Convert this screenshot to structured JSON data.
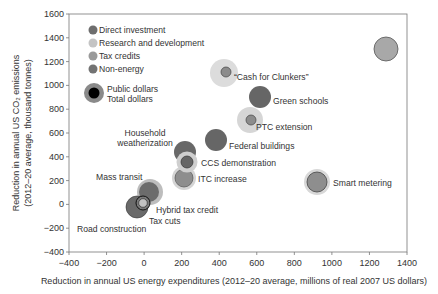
{
  "chart_data": {
    "type": "scatter",
    "subtype": "bubble",
    "title": "",
    "xlabel": "Reduction in annual US energy expenditures (2012–20 average, millions of real 2007 US dollars)",
    "ylabel_line1": "Reduction in annual US CO₂ emissions",
    "ylabel_line2": "(2012–20 average, thousand tonnes)",
    "xlim": [
      -400,
      1400
    ],
    "ylim": [
      -400,
      1600
    ],
    "x_ticks": [
      -400,
      -200,
      0,
      200,
      400,
      600,
      800,
      1000,
      1200,
      1400
    ],
    "y_ticks": [
      -400,
      -200,
      0,
      200,
      400,
      600,
      800,
      1000,
      1200,
      1400,
      1600
    ],
    "x_tick_labels": [
      "−400",
      "−200",
      "0",
      "200",
      "400",
      "600",
      "800",
      "1000",
      "1200",
      "1400"
    ],
    "y_tick_labels": [
      "−400",
      "−200",
      "0",
      "200",
      "400",
      "600",
      "800",
      "1000",
      "1200",
      "1400",
      "1600"
    ],
    "grid": false,
    "legend": {
      "position": "upper-left",
      "categories": [
        {
          "name": "Direct investment",
          "color": "#6e6e6e"
        },
        {
          "name": "Research and development",
          "color": "#c8c8c8"
        },
        {
          "name": "Tax credits",
          "color": "#9a9a9a"
        },
        {
          "name": "Non-energy",
          "color": "#7a7a7a"
        }
      ],
      "size_key": {
        "outer": "Public dollars",
        "inner": "Total dollars"
      }
    },
    "points": [
      {
        "label": "“Cash for Clunkers”",
        "x": 440,
        "y": 1100,
        "category": "Tax credits",
        "outer_r": 14,
        "inner_r": 5
      },
      {
        "label": "Green schools",
        "x": 620,
        "y": 900,
        "category": "Direct investment",
        "outer_r": 11,
        "inner_r": 0
      },
      {
        "label": "PTC extension",
        "x": 560,
        "y": 710,
        "category": "Tax credits",
        "outer_r": 13,
        "inner_r": 5
      },
      {
        "label": "Federal buildings",
        "x": 380,
        "y": 540,
        "category": "Direct investment",
        "outer_r": 11,
        "inner_r": 0
      },
      {
        "label": "Household weatherization",
        "x": 215,
        "y": 440,
        "category": "Direct investment",
        "outer_r": 11,
        "inner_r": 0
      },
      {
        "label": "CCS demonstration",
        "x": 225,
        "y": 350,
        "category": "Research and development",
        "outer_r": 11,
        "inner_r": 6
      },
      {
        "label": "ITC increase",
        "x": 210,
        "y": 220,
        "category": "Tax credits",
        "outer_r": 12,
        "inner_r": 9
      },
      {
        "label": "Mass transit",
        "x": 30,
        "y": 100,
        "category": "Direct investment",
        "outer_r": 13,
        "inner_r": 10
      },
      {
        "label": "Hybrid tax credit",
        "x": 0,
        "y": 10,
        "category": "Tax credits",
        "outer_r": 7,
        "inner_r": 4
      },
      {
        "label": "Tax cuts",
        "x": 0,
        "y": 10,
        "category": "Non-energy",
        "outer_r": 7,
        "inner_r": 4
      },
      {
        "label": "Road construction",
        "x": -40,
        "y": -20,
        "category": "Non-energy",
        "outer_r": 11,
        "inner_r": 0
      },
      {
        "label": "Smart metering",
        "x": 920,
        "y": 190,
        "category": "Research and development",
        "outer_r": 13,
        "inner_r": 10
      },
      {
        "label": "",
        "x": 1290,
        "y": 1300,
        "category": "Research and development",
        "outer_r": 12,
        "inner_r": 0
      }
    ]
  },
  "labels": {
    "legend_direct": "Direct investment",
    "legend_rd": "Research and development",
    "legend_tax": "Tax credits",
    "legend_nonenergy": "Non-energy",
    "legend_public": "Public dollars",
    "legend_total": "Total dollars",
    "cash": "“Cash for Clunkers”",
    "green": "Green schools",
    "ptc": "PTC extension",
    "federal": "Federal buildings",
    "household1": "Household",
    "household2": "weatherization",
    "ccs": "CCS demonstration",
    "itc": "ITC increase",
    "mass": "Mass transit",
    "hybrid": "Hybrid tax credit",
    "taxcuts": "Tax cuts",
    "road": "Road construction",
    "smart": "Smart metering"
  }
}
